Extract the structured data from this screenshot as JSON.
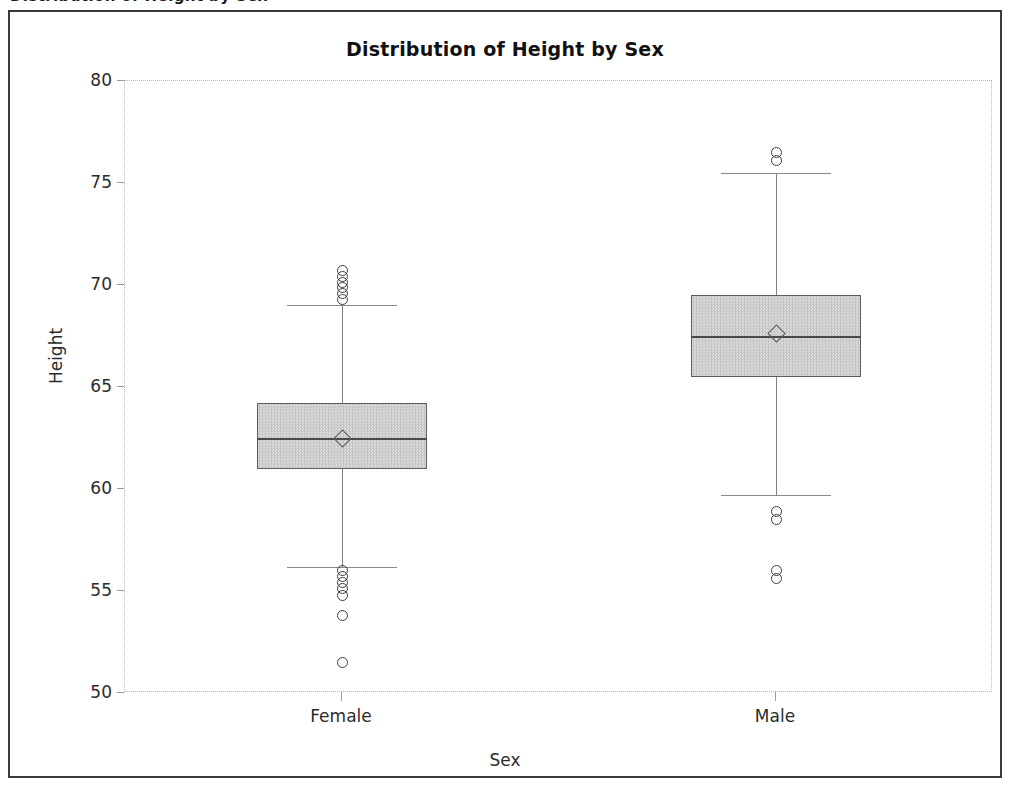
{
  "figure": {
    "clipped_top_text": "Distribution of Height by Sex",
    "title": "Distribution of Height by Sex"
  },
  "axes": {
    "y_title": "Height",
    "x_title": "Sex",
    "y_ticks": [
      "80",
      "75",
      "70",
      "65",
      "60",
      "55",
      "50"
    ],
    "x_ticks": [
      "Female",
      "Male"
    ]
  },
  "chart_data": {
    "type": "box",
    "title": "Distribution of Height by Sex",
    "xlabel": "Sex",
    "ylabel": "Height",
    "categories": [
      "Female",
      "Male"
    ],
    "ylim": [
      50,
      80
    ],
    "yticks": [
      50,
      55,
      60,
      65,
      70,
      75,
      80
    ],
    "grid": false,
    "legend": "none",
    "mean_marker": "diamond",
    "outlier_marker": "open-circle",
    "boxes": [
      {
        "category": "Female",
        "whisker_low": 56.2,
        "q1": 61.0,
        "median": 62.5,
        "q3": 64.2,
        "whisker_high": 69.0,
        "mean": 62.5,
        "outliers_high": [
          69.3,
          69.6,
          69.9,
          70.1,
          70.4,
          70.7
        ],
        "outliers_low": [
          56.0,
          55.7,
          55.4,
          55.1,
          54.8,
          53.8,
          51.5
        ]
      },
      {
        "category": "Male",
        "whisker_low": 59.7,
        "q1": 65.5,
        "median": 67.5,
        "q3": 69.5,
        "whisker_high": 75.5,
        "mean": 67.6,
        "outliers_high": [
          76.1,
          76.5
        ],
        "outliers_low": [
          58.5,
          58.9,
          55.6,
          56.0
        ]
      }
    ]
  },
  "colors": {
    "box_fill": "#d4d4d4",
    "box_border": "#5d5d5d",
    "median_line": "#4a4a4a",
    "whisker": "#808080",
    "outlier": "#3c3c3c",
    "frame": "#3a3a3a",
    "text": "#2b2b2b"
  }
}
